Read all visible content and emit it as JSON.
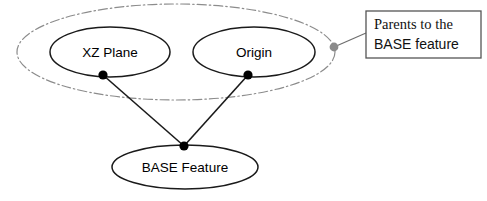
{
  "diagram": {
    "type": "node-relationship-diagram",
    "canvas": {
      "width": 487,
      "height": 201,
      "background": "#ffffff"
    },
    "colors": {
      "node_stroke": "#1a1a1a",
      "node_fill": "#ffffff",
      "group_stroke": "#8c8c8c",
      "connector_stroke": "#1a1a1a",
      "connector_dot": "#000000",
      "group_dot": "#8a8a8a",
      "callout_border": "#555555",
      "callout_fill": "#ffffff",
      "text": "#000000"
    },
    "group": {
      "name": "parents-group",
      "style": "dash-dot",
      "cx": 176,
      "cy": 52,
      "rx": 159,
      "ry": 48
    },
    "nodes": [
      {
        "id": "xz-plane",
        "label": "XZ Plane",
        "cx": 110,
        "cy": 52,
        "rx": 60,
        "ry": 25,
        "port": {
          "x": 103,
          "y": 75
        }
      },
      {
        "id": "origin",
        "label": "Origin",
        "cx": 254,
        "cy": 52,
        "rx": 61,
        "ry": 25,
        "port": {
          "x": 248,
          "y": 75
        }
      },
      {
        "id": "base-feature",
        "label": "BASE Feature",
        "cx": 185,
        "cy": 167,
        "rx": 73,
        "ry": 22,
        "port": {
          "x": 184,
          "y": 146
        }
      }
    ],
    "connectors": [
      {
        "id": "xz-plane-to-base",
        "from": "xz-plane",
        "to": "base-feature"
      },
      {
        "id": "origin-to-base",
        "from": "origin",
        "to": "base-feature"
      }
    ],
    "annotation": {
      "id": "parents-callout",
      "anchor_dot": {
        "x": 334,
        "y": 47
      },
      "leader": {
        "x1": 334,
        "y1": 47,
        "x2": 366,
        "y2": 33
      },
      "box": {
        "x": 366,
        "y": 11,
        "width": 115,
        "height": 47
      },
      "lines": [
        {
          "text": "Parents to the",
          "emphasis": false
        },
        {
          "text": "BASE feature",
          "emphasis": true
        }
      ],
      "text": "Parents to the BASE feature"
    }
  }
}
